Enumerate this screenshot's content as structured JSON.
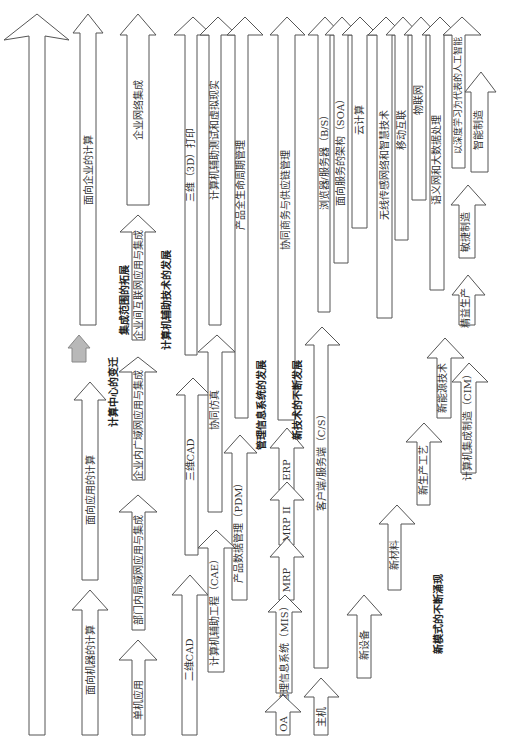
{
  "diagram": {
    "title": "",
    "colors": {
      "stroke": "#555555",
      "fill": "#ffffff",
      "text": "#333333",
      "gray_arrow": "#b8b8b8"
    },
    "section_labels": [
      {
        "id": "computing-center",
        "text": "计算中心的变迁"
      },
      {
        "id": "integration-scope",
        "text": "集成范围的拓展"
      },
      {
        "id": "cax",
        "text": "计算机辅助技术的发展"
      },
      {
        "id": "mis",
        "text": "管理信息系统的发展"
      },
      {
        "id": "new-tech",
        "text": "新技术的不断发展"
      },
      {
        "id": "new-mode",
        "text": "新模式的不断涌现"
      }
    ],
    "arrows": [
      {
        "id": "a-main",
        "label": ""
      },
      {
        "id": "a1",
        "label": "面向企业的计算"
      },
      {
        "id": "a2",
        "label": "面向应用的计算"
      },
      {
        "id": "a3",
        "label": "面向机器的计算"
      },
      {
        "id": "a4",
        "label": "企业网络集成"
      },
      {
        "id": "a5",
        "label": "企业间互联网应用与集成"
      },
      {
        "id": "a6",
        "label": "企业内广域网应用与集成"
      },
      {
        "id": "a7",
        "label": "部门内局域网应用与集成"
      },
      {
        "id": "a8",
        "label": "单机应用"
      },
      {
        "id": "a9",
        "label": "三维（3D）打印"
      },
      {
        "id": "a10",
        "label": "计算机辅助测试和虚拟现实"
      },
      {
        "id": "a11",
        "label": "产品全生命周期管理"
      },
      {
        "id": "a12",
        "label": "三维CAD"
      },
      {
        "id": "a13",
        "label": "协同仿真"
      },
      {
        "id": "a14",
        "label": "产品数据管理（PDM）"
      },
      {
        "id": "a15",
        "label": "二维CAD"
      },
      {
        "id": "a16",
        "label": "计算机辅助工程（CAE）"
      },
      {
        "id": "a17",
        "label": "协同商务与供应链管理"
      },
      {
        "id": "a18",
        "label": "ERP"
      },
      {
        "id": "a19",
        "label": "MRP II"
      },
      {
        "id": "a20",
        "label": "MRP"
      },
      {
        "id": "a21",
        "label": "管理信息系统（MIS）"
      },
      {
        "id": "a22",
        "label": "OA"
      },
      {
        "id": "a23",
        "label": "浏览器/服务器（B/S）"
      },
      {
        "id": "a24",
        "label": "面向服务的架构（SOA）"
      },
      {
        "id": "a25",
        "label": "云计算"
      },
      {
        "id": "a26",
        "label": "无线传感网络和智慧技术"
      },
      {
        "id": "a27",
        "label": "移动互联"
      },
      {
        "id": "a28",
        "label": "物联网"
      },
      {
        "id": "a29",
        "label": "语义网和大数据处理"
      },
      {
        "id": "a30",
        "label": "以深度学习为代表的人工智能"
      },
      {
        "id": "a31",
        "label": "客户端/服务端（C/S）"
      },
      {
        "id": "a32",
        "label": "主机"
      },
      {
        "id": "a33",
        "label": "新设备"
      },
      {
        "id": "a34",
        "label": "新材料"
      },
      {
        "id": "a35",
        "label": "新生产工艺"
      },
      {
        "id": "a36",
        "label": "新能源技术"
      },
      {
        "id": "a37",
        "label": "计算机集成制造（CIM）"
      },
      {
        "id": "a38",
        "label": "精益生产"
      },
      {
        "id": "a39",
        "label": "敏捷制造"
      },
      {
        "id": "a40",
        "label": "智能制造"
      }
    ]
  }
}
